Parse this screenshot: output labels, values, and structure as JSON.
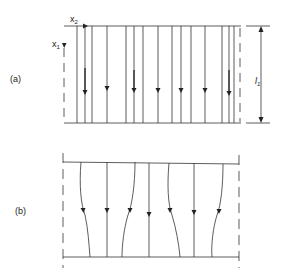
{
  "figure": {
    "panel_a": {
      "label": "(a)",
      "axis_x1": "x",
      "axis_x1_sub": "1",
      "axis_x2": "x",
      "axis_x2_sub": "2",
      "dimension_label": "l",
      "dimension_sub": "1",
      "description": "uniform straight vertical flow lines with downward arrows"
    },
    "panel_b": {
      "label": "(b)",
      "description": "flow lines alternately bowed, converging and diverging, with downward arrows"
    },
    "colors": {
      "line": "#333333",
      "background": "#ffffff"
    }
  }
}
